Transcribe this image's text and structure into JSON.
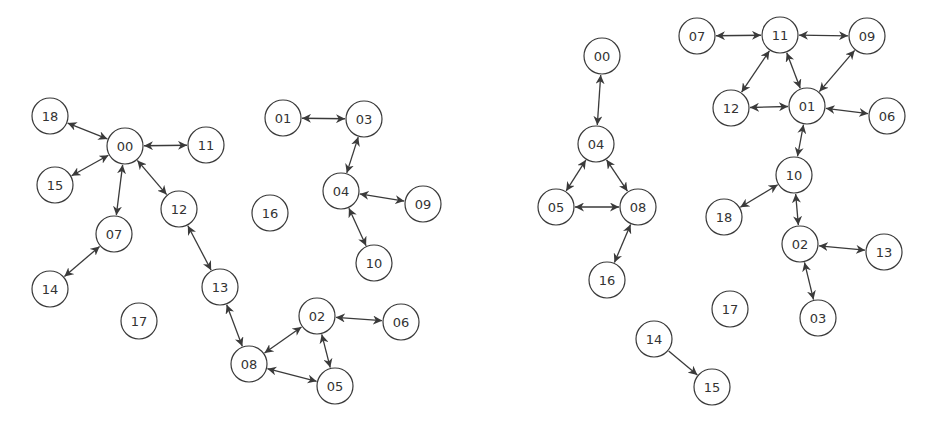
{
  "style": {
    "node_radius": 18,
    "stroke_color": "#3a3a3a",
    "fill_color": "#ffffff",
    "text_color": "#333333",
    "edge_color": "#3a3a3a"
  },
  "graphs": [
    {
      "name": "left-graph",
      "nodes": [
        {
          "id": "18",
          "x": 50,
          "y": 116
        },
        {
          "id": "00",
          "x": 125,
          "y": 146
        },
        {
          "id": "11",
          "x": 206,
          "y": 145
        },
        {
          "id": "15",
          "x": 55,
          "y": 185
        },
        {
          "id": "12",
          "x": 179,
          "y": 209
        },
        {
          "id": "07",
          "x": 114,
          "y": 234
        },
        {
          "id": "14",
          "x": 50,
          "y": 289
        },
        {
          "id": "13",
          "x": 220,
          "y": 287
        },
        {
          "id": "17",
          "x": 139,
          "y": 321
        },
        {
          "id": "01",
          "x": 283,
          "y": 118
        },
        {
          "id": "03",
          "x": 364,
          "y": 119
        },
        {
          "id": "16",
          "x": 270,
          "y": 213
        },
        {
          "id": "04",
          "x": 341,
          "y": 191
        },
        {
          "id": "09",
          "x": 423,
          "y": 204
        },
        {
          "id": "10",
          "x": 374,
          "y": 263
        },
        {
          "id": "02",
          "x": 317,
          "y": 316
        },
        {
          "id": "06",
          "x": 401,
          "y": 322
        },
        {
          "id": "08",
          "x": 249,
          "y": 364
        },
        {
          "id": "05",
          "x": 335,
          "y": 386
        }
      ],
      "edges": [
        {
          "from": "18",
          "to": "00",
          "dir": "both"
        },
        {
          "from": "00",
          "to": "11",
          "dir": "both"
        },
        {
          "from": "00",
          "to": "15",
          "dir": "both"
        },
        {
          "from": "00",
          "to": "07",
          "dir": "both"
        },
        {
          "from": "00",
          "to": "12",
          "dir": "both"
        },
        {
          "from": "07",
          "to": "14",
          "dir": "both"
        },
        {
          "from": "12",
          "to": "13",
          "dir": "both"
        },
        {
          "from": "13",
          "to": "08",
          "dir": "both"
        },
        {
          "from": "08",
          "to": "02",
          "dir": "both"
        },
        {
          "from": "08",
          "to": "05",
          "dir": "both"
        },
        {
          "from": "02",
          "to": "05",
          "dir": "both"
        },
        {
          "from": "02",
          "to": "06",
          "dir": "both"
        },
        {
          "from": "01",
          "to": "03",
          "dir": "both"
        },
        {
          "from": "03",
          "to": "04",
          "dir": "both"
        },
        {
          "from": "04",
          "to": "09",
          "dir": "both"
        },
        {
          "from": "04",
          "to": "10",
          "dir": "both"
        }
      ]
    },
    {
      "name": "right-graph",
      "nodes": [
        {
          "id": "00",
          "x": 602,
          "y": 56
        },
        {
          "id": "04",
          "x": 596,
          "y": 144
        },
        {
          "id": "05",
          "x": 556,
          "y": 207
        },
        {
          "id": "08",
          "x": 638,
          "y": 207
        },
        {
          "id": "16",
          "x": 607,
          "y": 280
        },
        {
          "id": "07",
          "x": 697,
          "y": 36
        },
        {
          "id": "11",
          "x": 780,
          "y": 35
        },
        {
          "id": "09",
          "x": 867,
          "y": 36
        },
        {
          "id": "12",
          "x": 731,
          "y": 108
        },
        {
          "id": "01",
          "x": 807,
          "y": 106
        },
        {
          "id": "06",
          "x": 887,
          "y": 116
        },
        {
          "id": "10",
          "x": 794,
          "y": 175
        },
        {
          "id": "18",
          "x": 724,
          "y": 217
        },
        {
          "id": "02",
          "x": 800,
          "y": 244
        },
        {
          "id": "13",
          "x": 884,
          "y": 252
        },
        {
          "id": "17",
          "x": 730,
          "y": 309
        },
        {
          "id": "03",
          "x": 818,
          "y": 318
        },
        {
          "id": "14",
          "x": 654,
          "y": 339
        },
        {
          "id": "15",
          "x": 712,
          "y": 387
        }
      ],
      "edges": [
        {
          "from": "00",
          "to": "04",
          "dir": "both"
        },
        {
          "from": "04",
          "to": "05",
          "dir": "both"
        },
        {
          "from": "04",
          "to": "08",
          "dir": "both"
        },
        {
          "from": "05",
          "to": "08",
          "dir": "both"
        },
        {
          "from": "08",
          "to": "16",
          "dir": "both"
        },
        {
          "from": "07",
          "to": "11",
          "dir": "both"
        },
        {
          "from": "11",
          "to": "09",
          "dir": "both"
        },
        {
          "from": "11",
          "to": "12",
          "dir": "both"
        },
        {
          "from": "11",
          "to": "01",
          "dir": "both"
        },
        {
          "from": "09",
          "to": "01",
          "dir": "both"
        },
        {
          "from": "12",
          "to": "01",
          "dir": "both"
        },
        {
          "from": "01",
          "to": "06",
          "dir": "both"
        },
        {
          "from": "01",
          "to": "10",
          "dir": "both"
        },
        {
          "from": "10",
          "to": "18",
          "dir": "both"
        },
        {
          "from": "10",
          "to": "02",
          "dir": "both"
        },
        {
          "from": "02",
          "to": "13",
          "dir": "both"
        },
        {
          "from": "02",
          "to": "03",
          "dir": "both"
        },
        {
          "from": "14",
          "to": "15",
          "dir": "forward"
        }
      ]
    }
  ]
}
